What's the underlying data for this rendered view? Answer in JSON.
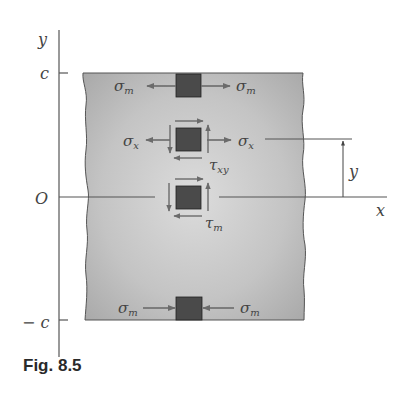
{
  "figure": {
    "caption": "Fig. 8.5",
    "axes": {
      "y_label": "y",
      "x_label": "x",
      "origin_label": "O",
      "top_tick_label": "c",
      "bottom_tick_label": "− c"
    },
    "dimension": {
      "label": "y"
    },
    "elements": {
      "top": {
        "left_label": "σ",
        "left_sub": "m",
        "right_label": "σ",
        "right_sub": "m",
        "stress": "tension"
      },
      "middle": {
        "left_label": "σ",
        "left_sub": "x",
        "right_label": "σ",
        "right_sub": "x",
        "shear_label": "τ",
        "shear_sub": "xy"
      },
      "center": {
        "shear_label": "τ",
        "shear_sub": "m"
      },
      "bottom": {
        "left_label": "σ",
        "left_sub": "m",
        "right_label": "σ",
        "right_sub": "m",
        "stress": "compression"
      }
    },
    "colors": {
      "beam_fill_light": "#d9d9d9",
      "beam_fill_dark": "#a8a8a8",
      "element_fill": "#4a4a4a",
      "arrow": "#6b6b6b",
      "line": "#555555"
    }
  }
}
